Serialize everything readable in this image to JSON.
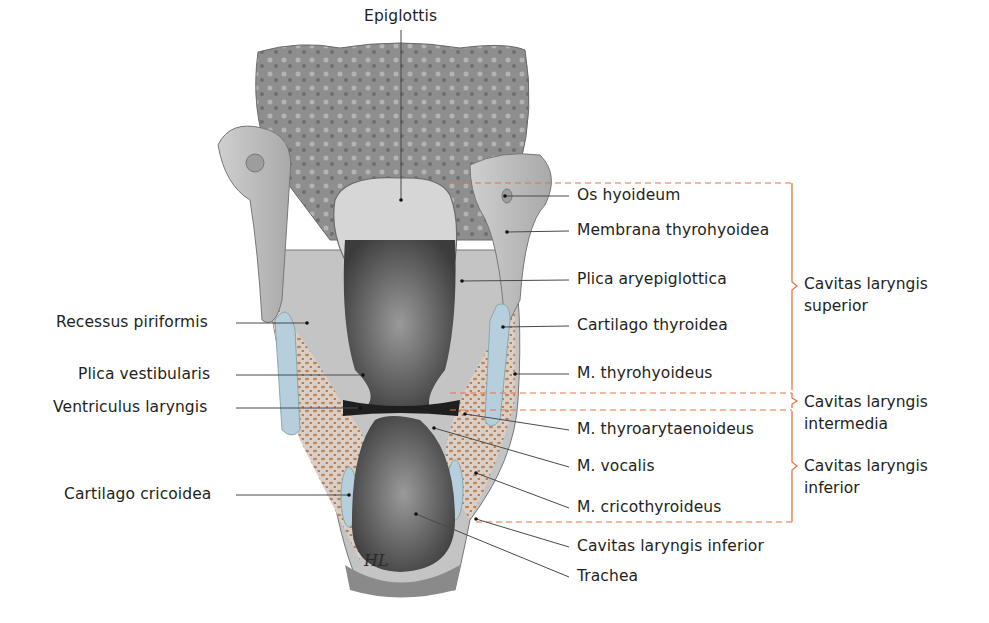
{
  "figure": {
    "title_label": "Epiglottis",
    "colors": {
      "leader_line": "#4a4a4a",
      "bracket": "#e8734a",
      "dashed_guide": "#e8734a",
      "cartilage": "#b9cfdc",
      "muscle": "#c98a5e",
      "tissue": "#b8b8b8",
      "lumen": "#3a3a3a"
    }
  },
  "labels_left": [
    {
      "id": "recessus-piriformis",
      "text": "Recessus piriformis",
      "x": 56,
      "y": 313,
      "tx": 307,
      "ty": 323
    },
    {
      "id": "plica-vestibularis",
      "text": "Plica vestibularis",
      "x": 78,
      "y": 365,
      "tx": 363,
      "ty": 375
    },
    {
      "id": "ventriculus-laryngis",
      "text": "Ventriculus laryngis",
      "x": 53,
      "y": 398,
      "tx": 360,
      "ty": 408
    },
    {
      "id": "cartilago-cricoidea",
      "text": "Cartilago cricoidea",
      "x": 64,
      "y": 485,
      "tx": 349,
      "ty": 495
    }
  ],
  "labels_right": [
    {
      "id": "os-hyoideum",
      "text": "Os hyoideum",
      "x": 577,
      "y": 186,
      "tx": 505,
      "ty": 196
    },
    {
      "id": "membrana-thyrohyoidea",
      "text": "Membrana thyrohyoidea",
      "x": 577,
      "y": 221,
      "tx": 507,
      "ty": 232
    },
    {
      "id": "plica-aryepiglottica",
      "text": "Plica aryepiglottica",
      "x": 577,
      "y": 270,
      "tx": 462,
      "ty": 281
    },
    {
      "id": "cartilago-thyroidea",
      "text": "Cartilago thyroidea",
      "x": 577,
      "y": 316,
      "tx": 503,
      "ty": 327
    },
    {
      "id": "m-thyrohyoideus",
      "text": "M. thyrohyoideus",
      "x": 577,
      "y": 364,
      "tx": 515,
      "ty": 374
    },
    {
      "id": "m-thyroarytaenoideus",
      "text": "M. thyroarytaenoideus",
      "x": 577,
      "y": 420,
      "tx": 465,
      "ty": 414
    },
    {
      "id": "m-vocalis",
      "text": "M. vocalis",
      "x": 577,
      "y": 457,
      "tx": 434,
      "ty": 428
    },
    {
      "id": "m-cricothyroideus",
      "text": "M. cricothyroideus",
      "x": 577,
      "y": 498,
      "tx": 476,
      "ty": 473
    },
    {
      "id": "cavitas-laryngis-inferior-label",
      "text": "Cavitas laryngis inferior",
      "x": 577,
      "y": 537,
      "tx": 476,
      "ty": 519
    },
    {
      "id": "trachea",
      "text": "Trachea",
      "x": 577,
      "y": 567,
      "tx": 416,
      "ty": 514
    }
  ],
  "regions": [
    {
      "id": "cavitas-superior",
      "line1": "Cavitas laryngis",
      "line2": "superior",
      "x": 804,
      "y": 273,
      "top": 183,
      "bottom": 390
    },
    {
      "id": "cavitas-intermedia",
      "line1": "Cavitas laryngis",
      "line2": "intermedia",
      "x": 804,
      "y": 391,
      "top": 393,
      "bottom": 410
    },
    {
      "id": "cavitas-inferior",
      "line1": "Cavitas laryngis",
      "line2": "inferior",
      "x": 804,
      "y": 455,
      "top": 410,
      "bottom": 522
    }
  ],
  "signature": "HL"
}
